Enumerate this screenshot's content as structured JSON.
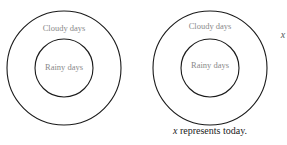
{
  "diagrams": [
    {
      "outer_label": "Cloudy days",
      "inner_label": "Rainy days"
    },
    {
      "outer_label": "Cloudy days",
      "inner_label": "Rainy days",
      "point_label": "x"
    }
  ],
  "caption": {
    "var": "x",
    "text": " represents today."
  },
  "colors": {
    "stroke": "#1a1a1a",
    "label": "#8a8a8a",
    "caption": "#222222"
  }
}
